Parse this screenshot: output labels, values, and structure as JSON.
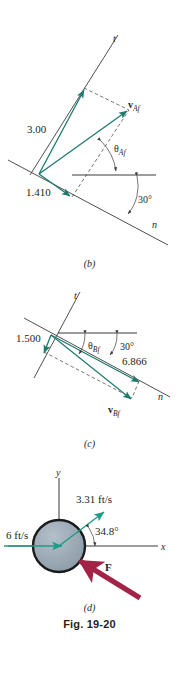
{
  "figure": {
    "title": "Fig. 19-20",
    "panels": [
      {
        "id": "b",
        "caption": "(b)",
        "axis_t": "t",
        "axis_n": "n",
        "labels": {
          "component_t": "3.00",
          "component_n": "1.410",
          "resultant": "v",
          "resultant_sub": "Af",
          "angle": "θ",
          "angle_sub": "Af",
          "incline_angle": "30°"
        },
        "colors": {
          "vector": "#1d7a6c",
          "line": "#3c3b3a",
          "dashed": "#3c3b3a"
        }
      },
      {
        "id": "c",
        "caption": "(c)",
        "axis_t": "t",
        "axis_n": "n",
        "labels": {
          "component_t": "1.500",
          "component_n": "6.866",
          "resultant": "v",
          "resultant_sub": "Bf",
          "angle": "θ",
          "angle_sub": "Bf",
          "incline_angle": "30°"
        },
        "colors": {
          "vector": "#1d7a6c",
          "line": "#3c3b3a",
          "dashed": "#3c3b3a"
        }
      },
      {
        "id": "d",
        "caption": "(d)",
        "axis_x": "x",
        "axis_y": "y",
        "labels": {
          "velocity_in": "6 ft/s",
          "velocity_out": "3.31 ft/s",
          "angle": "34.8°",
          "force": "F"
        },
        "colors": {
          "vector": "#1d9c86",
          "force": "#a32346",
          "disk_fill": "#9aa8b4",
          "disk_stroke": "#1b1b1b",
          "axis": "#3c3b3a"
        }
      }
    ]
  }
}
